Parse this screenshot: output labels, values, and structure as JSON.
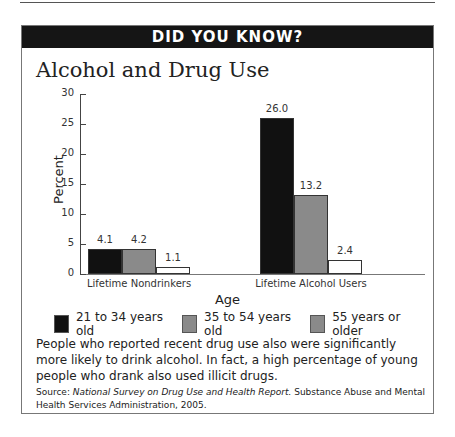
{
  "header": {
    "banner": "DID YOU KNOW?",
    "title": "Alcohol and Drug Use"
  },
  "chart_data": {
    "type": "bar",
    "title": "Alcohol and Drug Use",
    "xlabel": "Age",
    "ylabel": "Percent",
    "ylim": [
      0,
      30
    ],
    "yticks": [
      0,
      5,
      10,
      15,
      20,
      25,
      30
    ],
    "categories": [
      "Lifetime Nondrinkers",
      "Lifetime Alcohol Users"
    ],
    "series": [
      {
        "name": "21 to 34 years old",
        "color": "#111111",
        "values": [
          4.1,
          26.0
        ],
        "labels": [
          "4.1",
          "26.0"
        ]
      },
      {
        "name": "35 to 54 years old",
        "color": "#8a8a8a",
        "values": [
          4.2,
          13.2
        ],
        "labels": [
          "4.2",
          "13.2"
        ]
      },
      {
        "name": "55 years or older",
        "color": "#ffffff",
        "legend_color": "#8a8a8a",
        "values": [
          1.1,
          2.4
        ],
        "labels": [
          "1.1",
          "2.4"
        ]
      }
    ],
    "grid": false,
    "legend_position": "bottom"
  },
  "text": {
    "body": "People who reported recent drug use also were significantly more likely to drink alcohol. In fact, a high percentage of young people who drank also used illicit drugs.",
    "source_prefix": "Source: ",
    "source_title": "National Survey on Drug Use and Health Report.",
    "source_rest": " Substance Abuse and Mental Health Services Administration, 2005."
  }
}
